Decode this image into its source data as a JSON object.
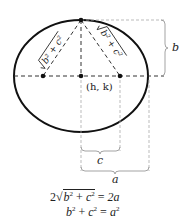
{
  "diagram": {
    "center_label": "(h, k)",
    "labels": {
      "b": "b",
      "c": "c",
      "a": "a"
    },
    "slanted_labels": {
      "left": "√(b² + c²)",
      "right": "√(b² + c²)"
    },
    "equations": {
      "line1": {
        "coef": "2",
        "radicand_b": "b",
        "plus": "+",
        "radicand_c": "c",
        "equals": "=",
        "rhs": "2a"
      },
      "line2": {
        "b": "b",
        "plus": "+",
        "c": "c",
        "equals": "=",
        "a": "a"
      }
    },
    "colors": {
      "ellipse": "#111111",
      "dashed": "#333333",
      "guide": "#aaaaaa"
    }
  }
}
